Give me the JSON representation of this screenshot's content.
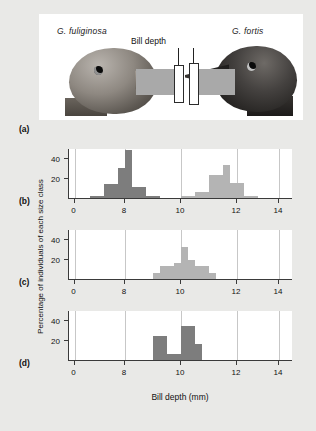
{
  "figure": {
    "panels": {
      "a": "(a)",
      "b": "(b)",
      "c": "(c)",
      "d": "(d)"
    }
  },
  "photo": {
    "left_species": "G. fuliginosa",
    "right_species": "G. fortis",
    "measure_caption": "Bill depth"
  },
  "axes": {
    "xlabel": "Bill depth (mm)",
    "ylabel": "Percentage of individuals of each size class",
    "x_ticks": [
      0,
      8,
      10,
      12,
      14
    ],
    "y_ticks": [
      20,
      40
    ]
  },
  "colors": {
    "bar_dark": "#7d7d7d",
    "bar_light": "#b4b4b4",
    "axis": "#3a3a3a",
    "grid": "#c7c7c7",
    "page_background": "#e9e9e7",
    "plot_background": "#ffffff"
  },
  "chart_data": [
    {
      "type": "bar",
      "panel": "(b)",
      "title": "",
      "xlabel": "Bill depth (mm)",
      "ylabel": "Percentage of individuals of each size class",
      "xlim": [
        7.0,
        15.0
      ],
      "ylim": [
        0,
        50
      ],
      "xtick_labels": [
        "0",
        "8",
        "10",
        "12",
        "14"
      ],
      "xtick_values": [
        7.2,
        9.0,
        11.0,
        13.0,
        14.5
      ],
      "grid": true,
      "bin_width": 0.25,
      "series": [
        {
          "name": "G. fuliginosa",
          "color": "#7d7d7d",
          "bin_starts": [
            7.75,
            8.0,
            8.25,
            8.5,
            8.75,
            9.0,
            9.25,
            9.5,
            9.75,
            10.0
          ],
          "values": [
            3,
            3,
            15,
            15,
            31,
            49,
            12,
            12,
            3,
            3
          ]
        },
        {
          "name": "G. fortis",
          "color": "#b4b4b4",
          "bin_starts": [
            11.0,
            11.25,
            11.5,
            11.75,
            12.0,
            12.25,
            12.5,
            12.75,
            13.0,
            13.25,
            13.5
          ],
          "values": [
            3,
            3,
            7,
            7,
            24,
            24,
            34,
            16,
            16,
            3,
            3
          ]
        }
      ]
    },
    {
      "type": "bar",
      "panel": "(c)",
      "title": "",
      "xlabel": "Bill depth (mm)",
      "ylabel": "Percentage of individuals of each size class",
      "xlim": [
        7.0,
        15.0
      ],
      "ylim": [
        0,
        50
      ],
      "xtick_labels": [
        "0",
        "8",
        "10",
        "12",
        "14"
      ],
      "xtick_values": [
        7.2,
        9.0,
        11.0,
        13.0,
        14.5
      ],
      "grid": true,
      "bin_width": 0.25,
      "series": [
        {
          "name": "G. fortis (allopatric)",
          "color": "#b4b4b4",
          "bin_starts": [
            10.0,
            10.25,
            10.5,
            10.75,
            11.0,
            11.25,
            11.5,
            11.75,
            12.0
          ],
          "values": [
            7,
            14,
            14,
            17,
            33,
            20,
            14,
            14,
            7
          ]
        }
      ]
    },
    {
      "type": "bar",
      "panel": "(d)",
      "title": "",
      "xlabel": "Bill depth (mm)",
      "ylabel": "Percentage of individuals of each size class",
      "xlim": [
        7.0,
        15.0
      ],
      "ylim": [
        0,
        50
      ],
      "xtick_labels": [
        "0",
        "8",
        "10",
        "12",
        "14"
      ],
      "xtick_values": [
        7.2,
        9.0,
        11.0,
        13.0,
        14.5
      ],
      "grid": true,
      "bin_width": 0.25,
      "series": [
        {
          "name": "G. fuliginosa (allopatric)",
          "color": "#7d7d7d",
          "bin_starts": [
            10.0,
            10.25,
            10.5,
            10.75,
            11.0,
            11.25,
            11.5
          ],
          "values": [
            25,
            25,
            7,
            7,
            35,
            35,
            17
          ]
        }
      ]
    }
  ]
}
